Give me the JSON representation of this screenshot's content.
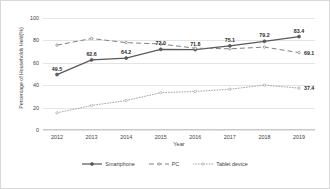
{
  "chart_data": {
    "type": "line",
    "title": "",
    "xlabel": "Year",
    "ylabel": "Percentage of Households Held(%)",
    "categories": [
      "2012",
      "2013",
      "2014",
      "2015",
      "2016",
      "2017",
      "2018",
      "2019"
    ],
    "ylim": [
      0,
      100
    ],
    "yticks": [
      0,
      20,
      40,
      60,
      80,
      100
    ],
    "grid": true,
    "legend_position": "bottom",
    "series": [
      {
        "name": "Smartphone",
        "style": "solid",
        "color": "#595959",
        "values": [
          49.5,
          62.6,
          64.2,
          72.0,
          71.8,
          75.1,
          79.2,
          83.4
        ],
        "labels": [
          "49.5",
          "62.6",
          "64.2",
          "72.0",
          "71.8",
          "75.1",
          "79.2",
          "83.4"
        ]
      },
      {
        "name": "PC",
        "style": "dashed",
        "color": "#808080",
        "values": [
          75.8,
          81.7,
          78.0,
          76.8,
          73.0,
          72.5,
          74.0,
          69.1
        ],
        "end_label": "69.1"
      },
      {
        "name": "Tablet device",
        "style": "dotted",
        "color": "#a6a6a6",
        "values": [
          15.3,
          21.9,
          26.3,
          33.3,
          34.4,
          36.4,
          40.1,
          37.4
        ],
        "end_label": "37.4"
      }
    ]
  },
  "legend": {
    "items": [
      "Smartphone",
      "PC",
      "Tablet device"
    ]
  }
}
